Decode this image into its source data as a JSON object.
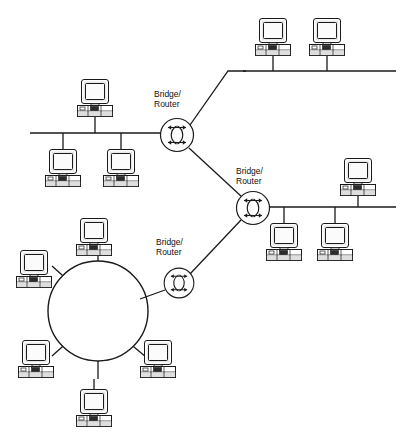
{
  "diagram": {
    "type": "network-topology",
    "background_color": "#ffffff",
    "line_color": "#1a1a1a",
    "device_fill": "#ffffff",
    "device_shade": "#d8d8d8",
    "screen_fill": "#f2f2f2",
    "accent_dark": "#3a3a3a"
  },
  "labels": [
    {
      "id": "router1",
      "line1": "Bridge/",
      "line2": "Router",
      "x": 154,
      "y": 92
    },
    {
      "id": "router2",
      "line1": "Bridge/",
      "line2": "Router",
      "x": 236,
      "y": 170
    },
    {
      "id": "router3",
      "line1": "Bridge/",
      "line2": "Router",
      "x": 156,
      "y": 240
    }
  ],
  "routers": [
    {
      "id": "router1",
      "name": "bridge-router-1",
      "cx": 177,
      "cy": 135,
      "r": 17
    },
    {
      "id": "router2",
      "name": "bridge-router-2",
      "cx": 253,
      "cy": 208,
      "r": 17
    },
    {
      "id": "router3",
      "name": "bridge-router-3",
      "cx": 179,
      "cy": 283,
      "r": 15
    }
  ],
  "buses": [
    {
      "id": "bus-left",
      "name": "bus-segment-left",
      "x1": 30,
      "y1": 133,
      "x2": 160,
      "y2": 133
    },
    {
      "id": "bus-top",
      "name": "bus-segment-top",
      "x1": 243,
      "y1": 71,
      "x2": 396,
      "y2": 71
    },
    {
      "id": "bus-right",
      "name": "bus-segment-right",
      "x1": 268,
      "y1": 207,
      "x2": 396,
      "y2": 207
    }
  ],
  "ring": {
    "id": "ring-lan",
    "name": "token-ring-lan",
    "cx": 98,
    "cy": 311,
    "r": 50
  },
  "links": [
    {
      "id": "link-bus-top-to-router1",
      "name": "link-top-bus-to-router-1",
      "points": "243,71 228,71 190,125"
    },
    {
      "id": "link-router1-router2",
      "name": "link-router-1-to-router-2",
      "points": "189,148 241,197"
    },
    {
      "id": "link-router2-router3",
      "name": "link-router-2-to-router-3",
      "points": "241,220 190,274"
    },
    {
      "id": "link-router3-ring",
      "name": "link-router-3-to-ring",
      "points": "166,290 139,300"
    }
  ],
  "computers": [
    {
      "id": "pc-left-top",
      "name": "computer-left-bus-top",
      "x": 77,
      "y": 79,
      "stem": "down",
      "stem_to": 133
    },
    {
      "id": "pc-left-b1",
      "name": "computer-left-bus-lower-1",
      "x": 45,
      "y": 148,
      "stem": "up",
      "stem_to": 133
    },
    {
      "id": "pc-left-b2",
      "name": "computer-left-bus-lower-2",
      "x": 103,
      "y": 148,
      "stem": "up",
      "stem_to": 133
    },
    {
      "id": "pc-top-1",
      "name": "computer-top-bus-1",
      "x": 255,
      "y": 18,
      "stem": "down",
      "stem_to": 71
    },
    {
      "id": "pc-top-2",
      "name": "computer-top-bus-2",
      "x": 309,
      "y": 18,
      "stem": "down",
      "stem_to": 71
    },
    {
      "id": "pc-right-top",
      "name": "computer-right-bus-top",
      "x": 340,
      "y": 158,
      "stem": "down",
      "stem_to": 207
    },
    {
      "id": "pc-right-b1",
      "name": "computer-right-bus-lower-1",
      "x": 266,
      "y": 222,
      "stem": "up",
      "stem_to": 207
    },
    {
      "id": "pc-right-b2",
      "name": "computer-right-bus-lower-2",
      "x": 317,
      "y": 222,
      "stem": "up",
      "stem_to": 207
    },
    {
      "id": "pc-ring-top",
      "name": "computer-ring-top",
      "x": 76,
      "y": 218,
      "stem": "down",
      "stem_to": 261
    },
    {
      "id": "pc-ring-left",
      "name": "computer-ring-left",
      "x": 17,
      "y": 250,
      "stem": "diag",
      "stem_to": 0
    },
    {
      "id": "pc-ring-bleft",
      "name": "computer-ring-bottom-left",
      "x": 20,
      "y": 340,
      "stem": "diag",
      "stem_to": 0
    },
    {
      "id": "pc-ring-bottom",
      "name": "computer-ring-bottom",
      "x": 76,
      "y": 380,
      "stem": "up",
      "stem_to": 361
    },
    {
      "id": "pc-ring-bright",
      "name": "computer-ring-bottom-right",
      "x": 140,
      "y": 340,
      "stem": "diag",
      "stem_to": 0
    }
  ],
  "ring_spokes": [
    {
      "id": "spoke-top",
      "name": "ring-spoke-top",
      "points": "98,261 98,247"
    },
    {
      "id": "spoke-left",
      "name": "ring-spoke-left",
      "points": "62,276 50,266"
    },
    {
      "id": "spoke-bleft",
      "name": "ring-spoke-bottom-left",
      "points": "62,346 50,356"
    },
    {
      "id": "spoke-bottom",
      "name": "ring-spoke-bottom",
      "points": "98,361 98,378"
    },
    {
      "id": "spoke-bright",
      "name": "ring-spoke-bottom-right",
      "points": "134,346 147,357"
    }
  ]
}
